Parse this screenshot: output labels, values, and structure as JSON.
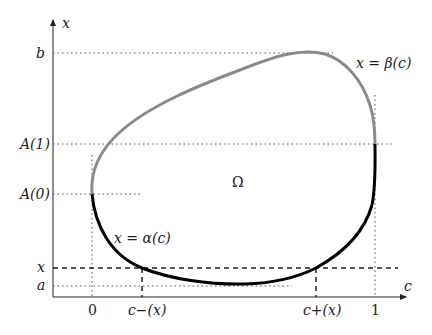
{
  "diagram": {
    "axes": {
      "vertical_label": "x",
      "horizontal_label": "c"
    },
    "y_ticks": {
      "b": "b",
      "A1": "A(1)",
      "A0": "A(0)",
      "x": "x",
      "a": "a"
    },
    "x_ticks": {
      "zero": "0",
      "c_minus": "c−(x)",
      "c_plus": "c+(x)",
      "one": "1"
    },
    "region_label": "Ω",
    "curves": {
      "beta": {
        "label": "x = β(c)",
        "color": "#8a8a8a"
      },
      "alpha": {
        "label": "x = α(c)",
        "color": "#000000"
      }
    },
    "colors": {
      "axis": "#222222",
      "guide": "#555555"
    }
  }
}
